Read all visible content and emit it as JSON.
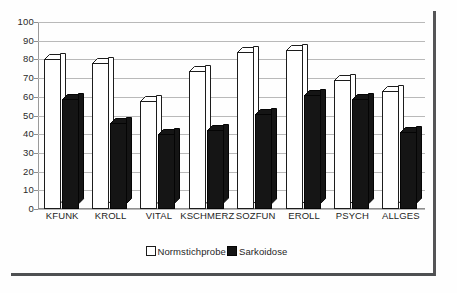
{
  "chart_data": {
    "type": "bar",
    "title": "",
    "subtitle": "",
    "xlabel": "",
    "ylabel": "",
    "ylim": [
      0,
      100
    ],
    "ytick_step": 10,
    "yticks": [
      100,
      90,
      80,
      70,
      60,
      50,
      40,
      30,
      20,
      10,
      0
    ],
    "grid": true,
    "legend_position": "bottom",
    "categories": [
      "KFUNK",
      "KROLL",
      "VITAL",
      "KSCHMERZ",
      "SOZFUN",
      "EROLL",
      "PSYCH",
      "ALLGES"
    ],
    "series": [
      {
        "name": "Normstichprobe",
        "color": "#ffffff",
        "values": [
          80,
          78,
          58,
          74,
          84,
          85,
          69,
          63
        ]
      },
      {
        "name": "Sarkoidose",
        "color": "#141414",
        "values": [
          59,
          46,
          40,
          42,
          51,
          61,
          59,
          41
        ]
      }
    ]
  },
  "legend": {
    "entries": [
      {
        "label": "Normstichprobe",
        "swatch": "light"
      },
      {
        "label": "Sarkoidose",
        "swatch": "dark"
      }
    ]
  }
}
